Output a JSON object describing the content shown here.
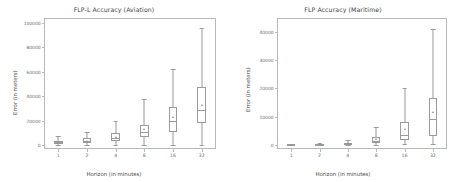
{
  "figure": {
    "width": 457,
    "height": 182,
    "background": "#ffffff",
    "line_color": "#9a9a9a",
    "text_color": "#4a4a4a"
  },
  "chart_data": [
    {
      "type": "box",
      "panel": "left",
      "title": "FLP-L Accuracy (Aviation)",
      "xlabel": "Horizon (in minutes)",
      "ylabel": "Error (in meters)",
      "categories": [
        "1",
        "2",
        "4",
        "8",
        "16",
        "32"
      ],
      "xtick_labels": [
        "1",
        "2",
        "4",
        "8",
        "16",
        "32"
      ],
      "ytick_labels": [
        "0",
        "20000",
        "40000",
        "60000",
        "80000",
        "100000"
      ],
      "ytick_values": [
        0,
        20000,
        40000,
        60000,
        80000,
        100000
      ],
      "ylim": [
        -3000,
        104000
      ],
      "grid": false,
      "legend": null,
      "boxes": [
        {
          "category": "1",
          "whisker_low": 0,
          "q1": 1200,
          "median": 2400,
          "q3": 3600,
          "whisker_high": 7600,
          "mean": 2600
        },
        {
          "category": "2",
          "whisker_low": 0,
          "q1": 1800,
          "median": 3400,
          "q3": 5600,
          "whisker_high": 11000,
          "mean": 3900
        },
        {
          "category": "4",
          "whisker_low": 0,
          "q1": 3400,
          "median": 5600,
          "q3": 10000,
          "whisker_high": 20000,
          "mean": 7200
        },
        {
          "category": "8",
          "whisker_low": 600,
          "q1": 6400,
          "median": 11000,
          "q3": 17000,
          "whisker_high": 38000,
          "mean": 13000
        },
        {
          "category": "16",
          "whisker_low": 400,
          "q1": 11000,
          "median": 20000,
          "q3": 31000,
          "whisker_high": 62000,
          "mean": 23000
        },
        {
          "category": "32",
          "whisker_low": 500,
          "q1": 18000,
          "median": 29000,
          "q3": 48000,
          "whisker_high": 96000,
          "mean": 33000
        }
      ]
    },
    {
      "type": "box",
      "panel": "right",
      "title": "FLP Accuracy (Maritime)",
      "xlabel": "Horizon (in minutes)",
      "ylabel": "Error (in meters)",
      "categories": [
        "1",
        "2",
        "4",
        "8",
        "16",
        "32"
      ],
      "xtick_labels": [
        "1",
        "2",
        "4",
        "8",
        "16",
        "32"
      ],
      "ytick_labels": [
        "0",
        "10000",
        "20000",
        "30000",
        "40000"
      ],
      "ytick_values": [
        0,
        10000,
        20000,
        30000,
        40000
      ],
      "ylim": [
        -1500,
        45000
      ],
      "grid": false,
      "legend": null,
      "boxes": [
        {
          "category": "1",
          "whisker_low": 0,
          "q1": 30,
          "median": 60,
          "q3": 110,
          "whisker_high": 220,
          "mean": 80
        },
        {
          "category": "2",
          "whisker_low": 0,
          "q1": 80,
          "median": 160,
          "q3": 280,
          "whisker_high": 650,
          "mean": 200
        },
        {
          "category": "4",
          "whisker_low": 0,
          "q1": 220,
          "median": 420,
          "q3": 750,
          "whisker_high": 1700,
          "mean": 520
        },
        {
          "category": "8",
          "whisker_low": 0,
          "q1": 800,
          "median": 1500,
          "q3": 2600,
          "whisker_high": 6200,
          "mean": 1900
        },
        {
          "category": "16",
          "whisker_low": 100,
          "q1": 1800,
          "median": 3300,
          "q3": 8200,
          "whisker_high": 20000,
          "mean": 5600
        },
        {
          "category": "32",
          "whisker_low": 200,
          "q1": 3200,
          "median": 9000,
          "q3": 16500,
          "whisker_high": 41000,
          "mean": 11500
        }
      ]
    }
  ]
}
